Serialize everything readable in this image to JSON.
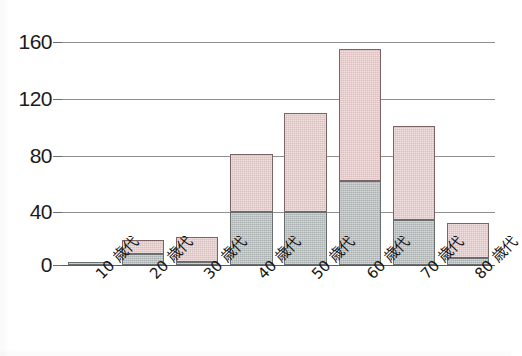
{
  "chart_data": {
    "type": "bar",
    "subtype": "stacked-vertical",
    "title": "",
    "subtitle": "",
    "xlabel": "",
    "ylabel": "",
    "categories": [
      "10 歳代",
      "20 歳代",
      "30 歳代",
      "40 歳代",
      "50 歳代",
      "60 歳代",
      "70 歳代",
      "80 歳代"
    ],
    "series": [
      {
        "name": "lower-gray",
        "color": "#b6bbbb",
        "values": [
          2,
          8,
          2,
          38,
          38,
          60,
          32,
          5
        ]
      },
      {
        "name": "upper-pink",
        "color": "#e7cbc9",
        "values": [
          0,
          10,
          18,
          42,
          71,
          95,
          68,
          25
        ]
      }
    ],
    "totals": [
      2,
      18,
      20,
      80,
      109,
      155,
      100,
      30
    ],
    "ylim": [
      0,
      160
    ],
    "yticks": [
      0,
      40,
      80,
      120,
      160
    ],
    "ytick_labels": [
      "0",
      "40",
      "80",
      "120",
      "160"
    ],
    "grid": true,
    "grid_axis": "y",
    "legend": "none",
    "annotations": []
  },
  "axis": {
    "y_tick_labels": [
      "160",
      "120",
      "80",
      "40",
      "0"
    ],
    "y_tick_values": [
      160,
      120,
      80,
      40,
      0
    ]
  },
  "colors": {
    "lower_fill": "#b6bbbb",
    "upper_fill": "#e7cbc9",
    "gridline": "#8f8f8f",
    "baseline": "#5b5b5b",
    "text": "#161616"
  }
}
